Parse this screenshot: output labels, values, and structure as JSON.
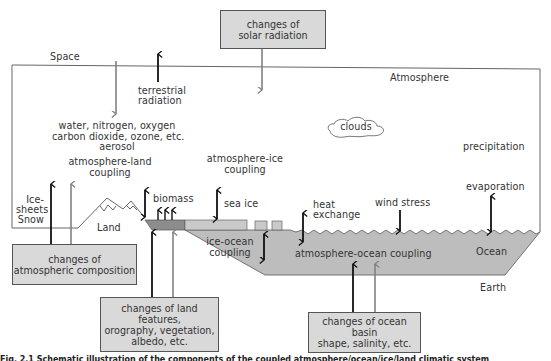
{
  "figure": {
    "type": "schematic diagram of the climate system",
    "regions": {
      "space": "Space",
      "atmosphere": "Atmosphere",
      "earth": "Earth",
      "land": "Land",
      "ocean": "Ocean"
    },
    "labels": {
      "terrestrial_radiation_1": "terrestrial",
      "terrestrial_radiation_2": "radiation",
      "gases_1": "water, nitrogen, oxygen",
      "gases_2": "carbon dioxide, ozone, etc.",
      "gases_3": "aerosol",
      "atm_land_1": "atmosphere-land",
      "atm_land_2": "coupling",
      "atm_ice_1": "atmosphere-ice",
      "atm_ice_2": "coupling",
      "clouds": "clouds",
      "precipitation": "precipitation",
      "evaporation": "evaporation",
      "ice_sheets_1": "Ice-",
      "ice_sheets_2": "sheets",
      "ice_sheets_3": "Snow",
      "biomass": "biomass",
      "sea_ice": "sea ice",
      "heat_exchange_1": "heat",
      "heat_exchange_2": "exchange",
      "wind_stress": "wind stress",
      "ice_ocean_1": "ice-ocean",
      "ice_ocean_2": "coupling",
      "atm_ocean": "atmosphere-ocean coupling"
    },
    "boxes": {
      "solar": "changes of\nsolar radiation",
      "atmospheric": "changes of\natmospheric composition",
      "land_features": "changes of land features,\norography, vegetation,\nalbedo, etc.",
      "ocean_basin": "changes of ocean basin\nshape, salinity, etc."
    },
    "caption": "Fig. 2.1 Schematic illustration of the components of the coupled atmosphere/ocean/ice/land climatic system",
    "colors": {
      "box_fill": "#d9d9d9",
      "ocean_fill": "#bdbdbd",
      "land_strip": "#8c8c8c",
      "sea_ice": "#c9c9c9",
      "arrow_dark": "#111111",
      "arrow_gray": "#808080",
      "line": "#555555"
    }
  }
}
